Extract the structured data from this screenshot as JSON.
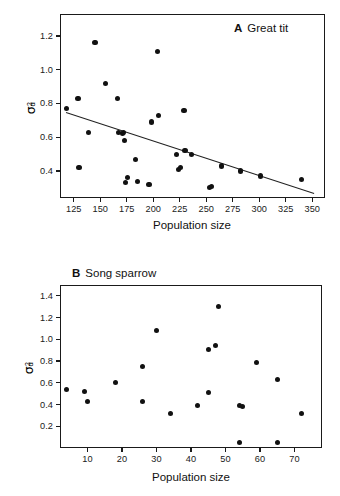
{
  "figure": {
    "background_color": "#ffffff",
    "point_color": "#111111",
    "axis_color": "#1a1a1a",
    "line_color": "#222222"
  },
  "panel_a": {
    "letter": "A",
    "title": "Great tit",
    "y_axis_label_parts": {
      "symbol": "σ",
      "superscript": "2",
      "subscript": "d"
    },
    "x_axis_title": "Population size",
    "x_ticks": [
      "125",
      "150",
      "175",
      "200",
      "225",
      "250",
      "275",
      "300",
      "325",
      "350"
    ],
    "y_ticks": [
      "0.4",
      "0.6",
      "0.8",
      "1.0",
      "1.2"
    ]
  },
  "panel_b": {
    "letter": "B",
    "title": "Song sparrow",
    "y_axis_label_parts": {
      "symbol": "σ",
      "superscript": "2",
      "subscript": "d"
    },
    "x_axis_title": "Population size",
    "x_ticks": [
      "10",
      "20",
      "30",
      "40",
      "50",
      "60",
      "70"
    ],
    "y_ticks": [
      "0.2",
      "0.4",
      "0.6",
      "0.8",
      "1.0",
      "1.2",
      "1.4"
    ]
  },
  "chart_data": [
    {
      "type": "scatter",
      "panel": "A",
      "title": "A  Great tit",
      "xlabel": "Population size",
      "ylabel": "σ²_d",
      "xlim": [
        112,
        362
      ],
      "ylim": [
        0.24,
        1.33
      ],
      "xticks": [
        125,
        150,
        175,
        200,
        225,
        250,
        275,
        300,
        325,
        350
      ],
      "yticks": [
        0.4,
        0.6,
        0.8,
        1.0,
        1.2
      ],
      "grid": false,
      "legend": false,
      "points": [
        {
          "x": 118,
          "y": 0.77
        },
        {
          "x": 129,
          "y": 0.83
        },
        {
          "x": 130,
          "y": 0.42
        },
        {
          "x": 139,
          "y": 0.63
        },
        {
          "x": 145,
          "y": 1.16
        },
        {
          "x": 155,
          "y": 0.92
        },
        {
          "x": 166,
          "y": 0.83
        },
        {
          "x": 167,
          "y": 0.63
        },
        {
          "x": 171,
          "y": 0.62
        },
        {
          "x": 172,
          "y": 0.63
        },
        {
          "x": 173,
          "y": 0.58
        },
        {
          "x": 174,
          "y": 0.33
        },
        {
          "x": 176,
          "y": 0.36
        },
        {
          "x": 183,
          "y": 0.47
        },
        {
          "x": 185,
          "y": 0.34
        },
        {
          "x": 196,
          "y": 0.32
        },
        {
          "x": 198,
          "y": 0.69
        },
        {
          "x": 204,
          "y": 1.11
        },
        {
          "x": 205,
          "y": 0.73
        },
        {
          "x": 222,
          "y": 0.5
        },
        {
          "x": 224,
          "y": 0.41
        },
        {
          "x": 226,
          "y": 0.42
        },
        {
          "x": 229,
          "y": 0.76
        },
        {
          "x": 230,
          "y": 0.52
        },
        {
          "x": 236,
          "y": 0.5
        },
        {
          "x": 253,
          "y": 0.3
        },
        {
          "x": 255,
          "y": 0.31
        },
        {
          "x": 264,
          "y": 0.43
        },
        {
          "x": 282,
          "y": 0.4
        },
        {
          "x": 301,
          "y": 0.37
        },
        {
          "x": 340,
          "y": 0.35
        }
      ],
      "trendline": {
        "x_start": 118,
        "y_start": 0.75,
        "x_end": 352,
        "y_end": 0.27,
        "description": "negative linear regression fit"
      }
    },
    {
      "type": "scatter",
      "panel": "B",
      "title": "B  Song sparrow",
      "xlabel": "Population size",
      "ylabel": "σ²_d",
      "xlim": [
        2,
        78
      ],
      "ylim": [
        0.0,
        1.5
      ],
      "xticks": [
        10,
        20,
        30,
        40,
        50,
        60,
        70
      ],
      "yticks": [
        0.2,
        0.4,
        0.6,
        0.8,
        1.0,
        1.2,
        1.4
      ],
      "grid": false,
      "legend": false,
      "points": [
        {
          "x": 4,
          "y": 0.54
        },
        {
          "x": 9,
          "y": 0.52
        },
        {
          "x": 10,
          "y": 0.43
        },
        {
          "x": 18,
          "y": 0.6
        },
        {
          "x": 26,
          "y": 0.43
        },
        {
          "x": 26,
          "y": 0.75
        },
        {
          "x": 30,
          "y": 1.08
        },
        {
          "x": 34,
          "y": 0.32
        },
        {
          "x": 42,
          "y": 0.39
        },
        {
          "x": 45,
          "y": 0.51
        },
        {
          "x": 45,
          "y": 0.91
        },
        {
          "x": 47,
          "y": 0.94
        },
        {
          "x": 48,
          "y": 1.3
        },
        {
          "x": 54,
          "y": 0.05
        },
        {
          "x": 54,
          "y": 0.39
        },
        {
          "x": 55,
          "y": 0.38
        },
        {
          "x": 59,
          "y": 0.79
        },
        {
          "x": 65,
          "y": 0.05
        },
        {
          "x": 65,
          "y": 0.63
        },
        {
          "x": 72,
          "y": 0.32
        }
      ],
      "trendline": null
    }
  ]
}
